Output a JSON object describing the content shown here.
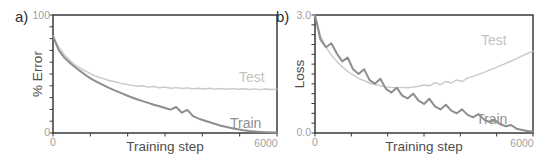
{
  "panel_labels": {
    "a": "a)",
    "b": "b)"
  },
  "colors": {
    "axis": "#3a3a3a",
    "test_line": "#c9c9c9",
    "train_line": "#8e8e8e",
    "tick_label": "#9f9f9f",
    "axis_title": "#4d4d4d",
    "background": "#ffffff"
  },
  "chart_data": [
    {
      "id": "a",
      "type": "line",
      "title": "",
      "xlabel": "Training step",
      "ylabel": "% Error",
      "xlim": [
        0,
        6000
      ],
      "ylim": [
        0,
        100
      ],
      "xtick_step": 1000,
      "ytick_step": 10,
      "xtick_labels": [
        "0",
        "6000"
      ],
      "ytick_labels": [
        "0",
        "100"
      ],
      "grid": false,
      "legend_position": "inline-right",
      "series": [
        {
          "name": "Test",
          "color": "#c9c9c9",
          "width": 1.4,
          "x": [
            0,
            150,
            300,
            450,
            600,
            750,
            900,
            1050,
            1200,
            1350,
            1500,
            1650,
            1800,
            1950,
            2100,
            2250,
            2400,
            2550,
            2700,
            2850,
            3000,
            3150,
            3300,
            3450,
            3600,
            3750,
            3900,
            4050,
            4200,
            4350,
            4500,
            4650,
            4800,
            4950,
            5100,
            5250,
            5400,
            5550,
            5700,
            5850,
            6000
          ],
          "y": [
            82,
            73,
            66.5,
            61.5,
            57.5,
            54.5,
            52,
            49.5,
            47.5,
            46,
            44.5,
            43.5,
            42.3,
            41.3,
            40.6,
            39.7,
            40.1,
            38.9,
            39.4,
            38.4,
            38.9,
            37.9,
            38.5,
            37.7,
            38.2,
            37.5,
            38.0,
            37.3,
            37.9,
            37.2,
            37.7,
            37.1,
            37.6,
            37.0,
            37.5,
            36.9,
            37.4,
            36.8,
            37.3,
            36.9,
            37.2
          ]
        },
        {
          "name": "Train",
          "color": "#8e8e8e",
          "width": 2.0,
          "x": [
            0,
            150,
            300,
            450,
            600,
            750,
            900,
            1050,
            1200,
            1350,
            1500,
            1650,
            1800,
            1950,
            2100,
            2250,
            2400,
            2550,
            2700,
            2850,
            3000,
            3150,
            3300,
            3450,
            3600,
            3750,
            3900,
            4050,
            4200,
            4350,
            4500,
            4650,
            4800,
            4950,
            5100,
            5250,
            5400,
            5550,
            5700,
            5850,
            6000
          ],
          "y": [
            82,
            70.5,
            64,
            59.5,
            55.5,
            52,
            48.5,
            45.5,
            43,
            40.5,
            38.2,
            36.2,
            34.2,
            32.2,
            30.3,
            28.6,
            27.0,
            25.5,
            24.0,
            22.6,
            21.2,
            19.8,
            22.0,
            17.2,
            19.6,
            14.2,
            12.2,
            10.6,
            9.1,
            7.6,
            6.2,
            5.1,
            4.1,
            3.1,
            2.3,
            1.7,
            1.3,
            0.9,
            0.7,
            0.5,
            0.4
          ]
        }
      ]
    },
    {
      "id": "b",
      "type": "line",
      "title": "",
      "xlabel": "Training step",
      "ylabel": "Loss",
      "xlim": [
        0,
        6000
      ],
      "ylim": [
        0,
        3.0
      ],
      "xtick_step": 1000,
      "ytick_step": 0.25,
      "xtick_labels": [
        "0",
        "6000"
      ],
      "ytick_labels": [
        "0.0",
        "3.0"
      ],
      "grid": false,
      "legend_position": "inline-right",
      "series": [
        {
          "name": "Test",
          "color": "#c9c9c9",
          "width": 1.4,
          "x": [
            0,
            150,
            300,
            450,
            600,
            750,
            900,
            1050,
            1200,
            1350,
            1500,
            1650,
            1800,
            1950,
            2100,
            2250,
            2400,
            2550,
            2700,
            2850,
            3000,
            3150,
            3300,
            3450,
            3600,
            3750,
            3900,
            4050,
            4200,
            4350,
            4500,
            4650,
            4800,
            4950,
            5100,
            5250,
            5400,
            5550,
            5700,
            5850,
            6000
          ],
          "y": [
            3.0,
            2.48,
            2.18,
            1.98,
            1.82,
            1.68,
            1.57,
            1.47,
            1.39,
            1.33,
            1.27,
            1.23,
            1.2,
            1.17,
            1.16,
            1.15,
            1.16,
            1.15,
            1.17,
            1.19,
            1.22,
            1.2,
            1.28,
            1.23,
            1.31,
            1.27,
            1.35,
            1.31,
            1.4,
            1.44,
            1.49,
            1.54,
            1.6,
            1.65,
            1.71,
            1.77,
            1.83,
            1.89,
            1.96,
            2.02,
            2.08
          ]
        },
        {
          "name": "Train",
          "color": "#8e8e8e",
          "width": 2.0,
          "x": [
            0,
            150,
            300,
            450,
            600,
            750,
            900,
            1050,
            1200,
            1350,
            1500,
            1650,
            1800,
            1950,
            2100,
            2250,
            2400,
            2550,
            2700,
            2850,
            3000,
            3150,
            3300,
            3450,
            3600,
            3750,
            3900,
            4050,
            4200,
            4350,
            4500,
            4650,
            4800,
            4950,
            5100,
            5250,
            5400,
            5550,
            5700,
            5850,
            6000
          ],
          "y": [
            3.0,
            2.38,
            2.18,
            2.28,
            2.02,
            1.82,
            1.92,
            1.62,
            1.5,
            1.62,
            1.35,
            1.25,
            1.38,
            1.12,
            1.03,
            1.15,
            0.95,
            0.88,
            1.0,
            0.82,
            0.74,
            0.87,
            0.68,
            0.6,
            0.72,
            0.57,
            0.5,
            0.6,
            0.46,
            0.4,
            0.48,
            0.34,
            0.28,
            0.33,
            0.22,
            0.17,
            0.2,
            0.11,
            0.08,
            0.05,
            0.04
          ]
        }
      ]
    }
  ]
}
